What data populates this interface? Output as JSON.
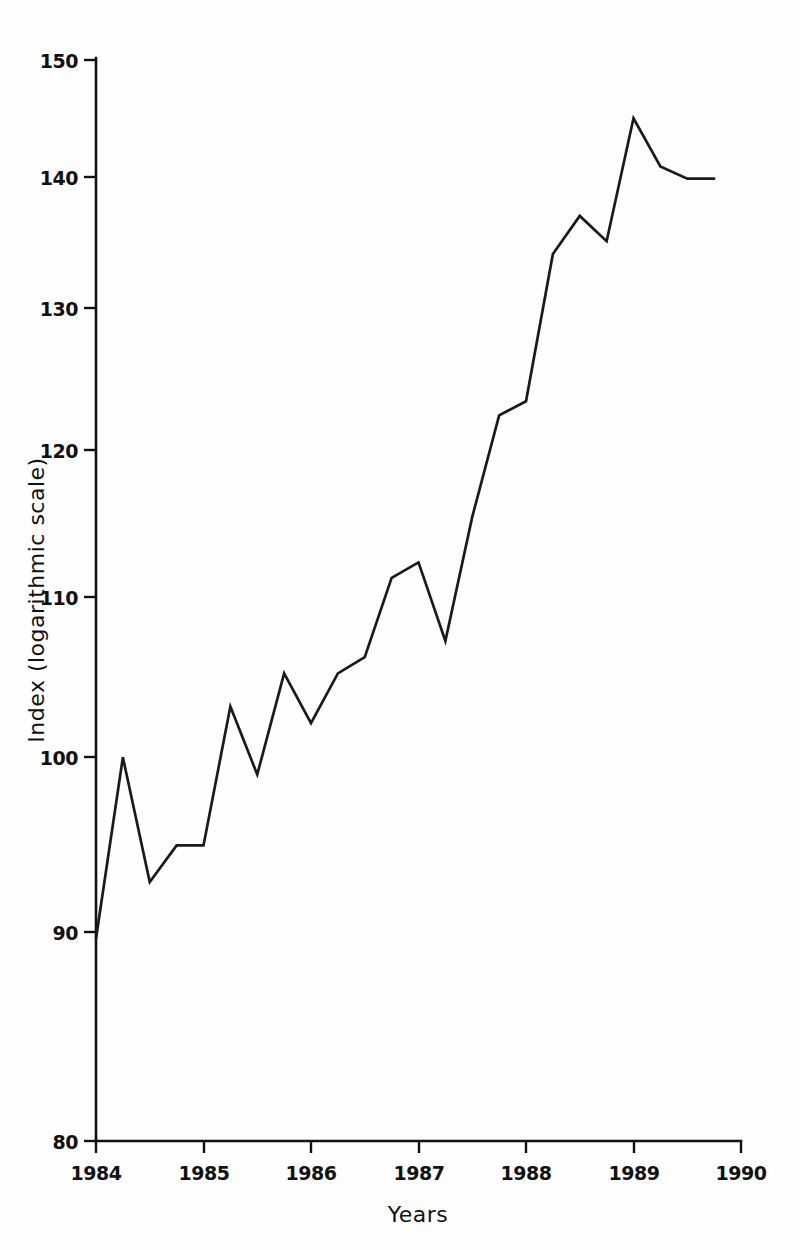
{
  "chart_data": {
    "type": "line",
    "title": "",
    "xlabel": "Years",
    "ylabel": "Index (logarithmic scale)",
    "yscale": "log",
    "ylim": [
      80,
      150
    ],
    "xlim": [
      1984,
      1990
    ],
    "grid": false,
    "legend": null,
    "yticks": [
      150,
      140,
      130,
      120,
      110,
      100,
      90,
      80
    ],
    "ytick_labels": [
      "150",
      "140",
      "130",
      "120",
      "110",
      "100",
      "90",
      "80"
    ],
    "xticks": [
      1984,
      1985,
      1986,
      1987,
      1988,
      1989,
      1990
    ],
    "xtick_labels": [
      "1984",
      "1985",
      "1986",
      "1987",
      "1988",
      "1989",
      "1990"
    ],
    "series": [
      {
        "name": "Index",
        "color": "#1a1a1a",
        "x": [
          1984.0,
          1984.25,
          1984.5,
          1984.75,
          1985.0,
          1985.25,
          1985.5,
          1985.75,
          1986.0,
          1986.25,
          1986.5,
          1986.75,
          1987.0,
          1987.25,
          1987.5,
          1987.75,
          1988.0,
          1988.25,
          1988.5,
          1988.75,
          1989.0,
          1989.25,
          1989.5,
          1989.75
        ],
        "values": [
          90,
          100,
          93,
          95,
          95,
          103,
          99,
          105,
          102,
          105,
          106,
          111,
          112,
          107,
          115,
          122,
          123,
          134,
          137,
          135,
          145,
          141,
          140,
          140
        ]
      }
    ],
    "axis_color": "#111111",
    "background": "#ffffff"
  },
  "axis": {
    "y_title": "Index (logarithmic scale)",
    "x_title": "Years"
  }
}
